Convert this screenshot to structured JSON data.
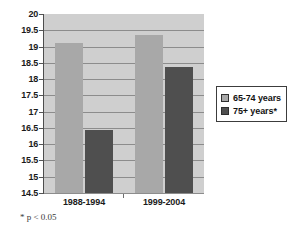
{
  "chart_data": {
    "type": "bar",
    "title": "",
    "xlabel": "",
    "ylabel": "",
    "categories": [
      "1988-1994",
      "1999-2004"
    ],
    "series": [
      {
        "name": "65-74 years",
        "values": [
          19.12,
          19.35
        ],
        "color": "#a8a8a8"
      },
      {
        "name": "75+ years*",
        "values": [
          16.45,
          18.38
        ],
        "color": "#4f4f4f"
      }
    ],
    "ylim": [
      14.5,
      20
    ],
    "ytick_step": 0.5,
    "ytick_labels": [
      "20",
      "19.5",
      "19",
      "18.5",
      "18",
      "17.5",
      "17",
      "16.5",
      "16",
      "15.5",
      "15",
      "14.5"
    ],
    "grid": true,
    "legend_position": "right",
    "annotations": [
      "* p < 0.05"
    ]
  },
  "legend": {
    "items": [
      {
        "label": "65-74 years"
      },
      {
        "label": "75+ years*"
      }
    ]
  },
  "footnote": {
    "text": "* p < 0.05"
  },
  "colors": {
    "series_light": "#a8a8a8",
    "series_dark": "#4f4f4f",
    "plot_background": "#cfcfcf",
    "gridline": "#8c8c8c",
    "axis": "#4d4d4d"
  }
}
